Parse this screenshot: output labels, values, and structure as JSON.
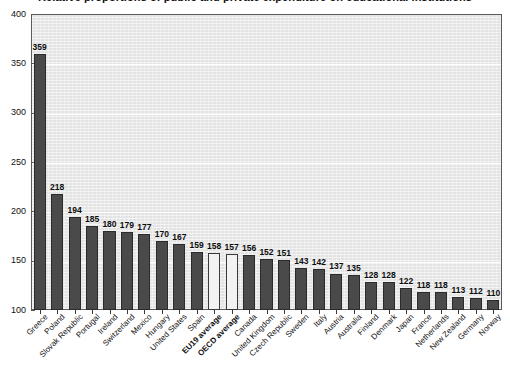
{
  "title": "Relative proportions of public and private expenditure on educational institutions",
  "chart_data": {
    "type": "bar",
    "title": "Relative proportions of public and private expenditure on educational institutions",
    "xlabel": "",
    "ylabel": "",
    "ylim": [
      100,
      400
    ],
    "yticks": [
      100,
      150,
      200,
      250,
      300,
      350,
      400
    ],
    "grid": true,
    "legend": "none",
    "categories": [
      "Greece",
      "Poland",
      "Slovak Republic",
      "Portugal",
      "Ireland",
      "Switzerland",
      "Mexico",
      "Hungary",
      "United States",
      "Spain",
      "EU19 average",
      "OECD average",
      "Canada",
      "United Kingdom",
      "Czech Republic",
      "Sweden",
      "Italy",
      "Austria",
      "Australia",
      "Finland",
      "Denmark",
      "Japan",
      "France",
      "Netherlands",
      "New Zealand",
      "Germany",
      "Norway"
    ],
    "values": [
      359,
      218,
      194,
      185,
      180,
      179,
      177,
      170,
      167,
      159,
      158,
      157,
      156,
      152,
      151,
      143,
      142,
      137,
      135,
      128,
      128,
      122,
      118,
      118,
      113,
      112,
      110
    ],
    "highlighted": [
      "EU19 average",
      "OECD average"
    ],
    "colors": {
      "bar": "#4a4a4a",
      "bar_highlight": "#f2f2f2",
      "bar_outline": "#2b2b2b",
      "plot_background": "#e3e3e3",
      "gridline": "#ffffff",
      "axis": "#5a5a5a",
      "text": "#111111"
    }
  }
}
